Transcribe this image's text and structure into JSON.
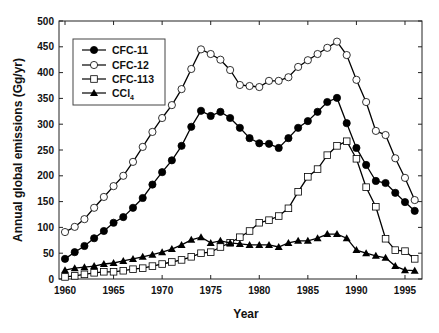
{
  "chart_data": {
    "type": "line",
    "title": "",
    "xlabel": "Year",
    "ylabel": "Annual global emissions (Gg/yr)",
    "xlim": [
      1959.6,
      1997.7
    ],
    "ylim": [
      0,
      500
    ],
    "xticks": [
      1960,
      1965,
      1970,
      1975,
      1980,
      1985,
      1990,
      1995
    ],
    "yticks": [
      0,
      50,
      100,
      150,
      200,
      250,
      300,
      350,
      400,
      450,
      500
    ],
    "grid": false,
    "legend_position": "upper left",
    "x": [
      1960,
      1961,
      1962,
      1963,
      1964,
      1965,
      1966,
      1967,
      1968,
      1969,
      1970,
      1971,
      1972,
      1973,
      1974,
      1975,
      1976,
      1977,
      1978,
      1979,
      1980,
      1981,
      1982,
      1983,
      1984,
      1985,
      1986,
      1987,
      1988,
      1989,
      1990,
      1991,
      1992,
      1993,
      1994,
      1995,
      1996
    ],
    "series": [
      {
        "name": "CFC-11",
        "marker": "filled-circle",
        "values": [
          39,
          52,
          64,
          79,
          93,
          109,
          120,
          138,
          157,
          183,
          207,
          230,
          258,
          295,
          326,
          316,
          324,
          312,
          293,
          273,
          263,
          262,
          254,
          273,
          293,
          306,
          324,
          343,
          351,
          302,
          254,
          221,
          190,
          186,
          167,
          149,
          132
        ]
      },
      {
        "name": "CFC-12",
        "marker": "open-circle",
        "values": [
          91,
          101,
          116,
          138,
          159,
          180,
          200,
          227,
          256,
          285,
          312,
          337,
          368,
          407,
          445,
          436,
          425,
          405,
          376,
          374,
          372,
          384,
          384,
          391,
          411,
          424,
          436,
          448,
          460,
          434,
          386,
          343,
          287,
          279,
          234,
          196,
          153
        ]
      },
      {
        "name": "CFC-113",
        "marker": "open-square",
        "values": [
          4,
          6,
          9,
          12,
          14,
          14,
          16,
          19,
          21,
          25,
          29,
          33,
          37,
          43,
          50,
          52,
          62,
          70,
          81,
          93,
          109,
          114,
          122,
          137,
          169,
          198,
          213,
          240,
          258,
          267,
          233,
          178,
          140,
          78,
          56,
          54,
          39
        ]
      },
      {
        "name": "CCl4",
        "marker": "filled-triangle",
        "values": [
          17,
          21,
          23,
          25,
          29,
          31,
          35,
          39,
          43,
          47,
          52,
          58,
          66,
          76,
          81,
          70,
          74,
          70,
          68,
          66,
          66,
          66,
          62,
          70,
          74,
          74,
          79,
          87,
          87,
          79,
          56,
          50,
          45,
          41,
          25,
          17,
          16
        ]
      }
    ]
  },
  "labels": {
    "xlabel": "Year",
    "ylabel": "Annual global emissions (Gg/yr)",
    "legend": [
      "CFC-11",
      "CFC-12",
      "CFC-113",
      "CCl"
    ],
    "legend_ccl4_subscript": "4"
  },
  "colors": {
    "line": "#000000",
    "axis": "#222222",
    "background": "#ffffff"
  }
}
